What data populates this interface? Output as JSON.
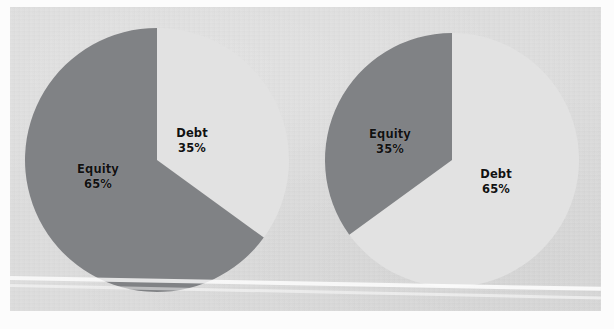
{
  "figure": {
    "width": 614,
    "height": 329,
    "panel_color": "#dcdcdc",
    "page_color": "#fcfcfc"
  },
  "colors": {
    "equity_slice": "#808285",
    "debt_slice": "#e2e2e2",
    "label_text": "#111111",
    "panel_background": "#dcdcdc"
  },
  "chart_data": [
    {
      "type": "pie",
      "name": "left-pie-chart",
      "title": "",
      "categories": [
        "Equity",
        "Debt"
      ],
      "values": [
        65,
        35
      ],
      "labels": [
        "Equity\n65%",
        "Debt\n35%"
      ],
      "colors": [
        "#808285",
        "#e2e2e2"
      ],
      "start_angle_deg": 90,
      "direction": "counterclockwise",
      "center": [
        157,
        160
      ],
      "radius": 132,
      "legend": "none",
      "grid": false,
      "slices": [
        {
          "label": "Equity",
          "percent": "65%",
          "value": 65,
          "color": "#808285"
        },
        {
          "label": "Debt",
          "percent": "35%",
          "value": 35,
          "color": "#e2e2e2"
        }
      ]
    },
    {
      "type": "pie",
      "name": "right-pie-chart",
      "title": "",
      "categories": [
        "Equity",
        "Debt"
      ],
      "values": [
        35,
        65
      ],
      "labels": [
        "Equity\n35%",
        "Debt\n65%"
      ],
      "colors": [
        "#808285",
        "#e2e2e2"
      ],
      "start_angle_deg": 90,
      "direction": "counterclockwise",
      "center": [
        452,
        160
      ],
      "radius": 127,
      "legend": "none",
      "grid": false,
      "slices": [
        {
          "label": "Equity",
          "percent": "35%",
          "value": 35,
          "color": "#808285"
        },
        {
          "label": "Debt",
          "percent": "65%",
          "value": 65,
          "color": "#e2e2e2"
        }
      ]
    }
  ],
  "left_chart": {
    "equity": {
      "label": "Equity",
      "percent": "65%"
    },
    "debt": {
      "label": "Debt",
      "percent": "35%"
    }
  },
  "right_chart": {
    "equity": {
      "label": "Equity",
      "percent": "35%"
    },
    "debt": {
      "label": "Debt",
      "percent": "65%"
    }
  }
}
